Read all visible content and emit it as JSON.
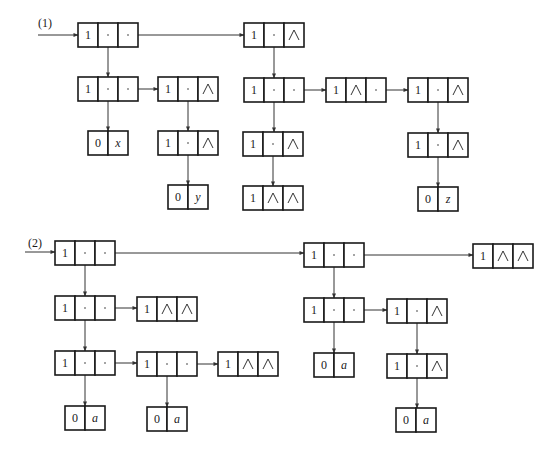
{
  "diagram": {
    "width": 557,
    "height": 462,
    "line_color": "#333333",
    "sections": [
      {
        "id": "section-1",
        "label": "(1)",
        "label_pos": [
          38,
          27
        ],
        "entry_arrow": {
          "from": [
            38,
            35
          ],
          "to": [
            78,
            35
          ]
        },
        "nodes": [
          {
            "id": "n1a",
            "x": 78,
            "y": 23,
            "cells": [
              "1",
              "ptr",
              "ptr"
            ]
          },
          {
            "id": "n1b",
            "x": 244,
            "y": 23,
            "cells": [
              "1",
              "ptr",
              "∧"
            ]
          },
          {
            "id": "n1a2",
            "x": 78,
            "y": 77,
            "cells": [
              "1",
              "ptr",
              "ptr"
            ]
          },
          {
            "id": "n1a3",
            "x": 158,
            "y": 77,
            "cells": [
              "1",
              "ptr",
              "∧"
            ]
          },
          {
            "id": "n1b2",
            "x": 244,
            "y": 78,
            "cells": [
              "1",
              "ptr",
              "ptr"
            ]
          },
          {
            "id": "n1b3",
            "x": 326,
            "y": 78,
            "cells": [
              "1",
              "∧",
              "ptr"
            ]
          },
          {
            "id": "n1b4",
            "x": 408,
            "y": 78,
            "cells": [
              "1",
              "ptr",
              "∧"
            ]
          },
          {
            "id": "n1x",
            "x": 88,
            "y": 131,
            "cells": [
              "0",
              "x"
            ],
            "atom": true
          },
          {
            "id": "n1a4",
            "x": 158,
            "y": 131,
            "cells": [
              "1",
              "ptr",
              "∧"
            ]
          },
          {
            "id": "n1b5",
            "x": 243,
            "y": 132,
            "cells": [
              "1",
              "ptr",
              "∧"
            ]
          },
          {
            "id": "n1b6",
            "x": 408,
            "y": 133,
            "cells": [
              "1",
              "ptr",
              "∧"
            ]
          },
          {
            "id": "n1y",
            "x": 168,
            "y": 185,
            "cells": [
              "0",
              "y"
            ],
            "atom": true
          },
          {
            "id": "n1b7",
            "x": 243,
            "y": 186,
            "cells": [
              "1",
              "∧",
              "∧"
            ]
          },
          {
            "id": "n1z",
            "x": 418,
            "y": 187,
            "cells": [
              "0",
              "z"
            ],
            "atom": true
          }
        ],
        "edges": [
          {
            "from": "n1a",
            "slot": 2,
            "to": "n1b",
            "dir": "right"
          },
          {
            "from": "n1a",
            "slot": 1,
            "to": "n1a2",
            "dir": "down"
          },
          {
            "from": "n1a2",
            "slot": 2,
            "to": "n1a3",
            "dir": "right"
          },
          {
            "from": "n1a2",
            "slot": 1,
            "to": "n1x",
            "dir": "down"
          },
          {
            "from": "n1a3",
            "slot": 1,
            "to": "n1a4",
            "dir": "down"
          },
          {
            "from": "n1a4",
            "slot": 1,
            "to": "n1y",
            "dir": "down"
          },
          {
            "from": "n1b",
            "slot": 1,
            "to": "n1b2",
            "dir": "down"
          },
          {
            "from": "n1b2",
            "slot": 2,
            "to": "n1b3",
            "dir": "right"
          },
          {
            "from": "n1b3",
            "slot": 2,
            "to": "n1b4",
            "dir": "right"
          },
          {
            "from": "n1b2",
            "slot": 1,
            "to": "n1b5",
            "dir": "down"
          },
          {
            "from": "n1b5",
            "slot": 1,
            "to": "n1b7",
            "dir": "down"
          },
          {
            "from": "n1b4",
            "slot": 1,
            "to": "n1b6",
            "dir": "down"
          },
          {
            "from": "n1b6",
            "slot": 1,
            "to": "n1z",
            "dir": "down"
          }
        ]
      },
      {
        "id": "section-2",
        "label": "(2)",
        "label_pos": [
          28,
          247
        ],
        "entry_arrow": {
          "from": [
            25,
            252
          ],
          "to": [
            55,
            252
          ]
        },
        "nodes": [
          {
            "id": "n2c",
            "x": 55,
            "y": 241,
            "cells": [
              "1",
              "ptr",
              "ptr"
            ]
          },
          {
            "id": "n2d",
            "x": 304,
            "y": 243,
            "cells": [
              "1",
              "ptr",
              "ptr"
            ]
          },
          {
            "id": "n2e",
            "x": 473,
            "y": 244,
            "cells": [
              "1",
              "∧",
              "∧"
            ]
          },
          {
            "id": "n2c2",
            "x": 55,
            "y": 296,
            "cells": [
              "1",
              "ptr",
              "ptr"
            ]
          },
          {
            "id": "n2c3",
            "x": 137,
            "y": 297,
            "cells": [
              "1",
              "∧",
              "∧"
            ]
          },
          {
            "id": "n2d2",
            "x": 304,
            "y": 298,
            "cells": [
              "1",
              "ptr",
              "ptr"
            ]
          },
          {
            "id": "n2d3",
            "x": 387,
            "y": 299,
            "cells": [
              "1",
              "ptr",
              "∧"
            ]
          },
          {
            "id": "n2c4",
            "x": 55,
            "y": 351,
            "cells": [
              "1",
              "ptr",
              "ptr"
            ]
          },
          {
            "id": "n2c5",
            "x": 137,
            "y": 352,
            "cells": [
              "1",
              "ptr",
              "ptr"
            ]
          },
          {
            "id": "n2c6",
            "x": 218,
            "y": 352,
            "cells": [
              "1",
              "∧",
              "∧"
            ]
          },
          {
            "id": "n2a1",
            "x": 314,
            "y": 353,
            "cells": [
              "0",
              "a"
            ],
            "atom": true
          },
          {
            "id": "n2d4",
            "x": 387,
            "y": 354,
            "cells": [
              "1",
              "ptr",
              "∧"
            ]
          },
          {
            "id": "n2a2",
            "x": 65,
            "y": 406,
            "cells": [
              "0",
              "a"
            ],
            "atom": true
          },
          {
            "id": "n2a3",
            "x": 147,
            "y": 407,
            "cells": [
              "0",
              "a"
            ],
            "atom": true
          },
          {
            "id": "n2a4",
            "x": 396,
            "y": 408,
            "cells": [
              "0",
              "a"
            ],
            "atom": true
          }
        ],
        "edges": [
          {
            "from": "n2c",
            "slot": 2,
            "to": "n2d",
            "dir": "right"
          },
          {
            "from": "n2d",
            "slot": 2,
            "to": "n2e",
            "dir": "right"
          },
          {
            "from": "n2c",
            "slot": 1,
            "to": "n2c2",
            "dir": "down"
          },
          {
            "from": "n2c2",
            "slot": 2,
            "to": "n2c3",
            "dir": "right"
          },
          {
            "from": "n2c2",
            "slot": 1,
            "to": "n2c4",
            "dir": "down"
          },
          {
            "from": "n2c4",
            "slot": 2,
            "to": "n2c5",
            "dir": "right"
          },
          {
            "from": "n2c5",
            "slot": 2,
            "to": "n2c6",
            "dir": "right"
          },
          {
            "from": "n2c4",
            "slot": 1,
            "to": "n2a2",
            "dir": "down"
          },
          {
            "from": "n2c5",
            "slot": 1,
            "to": "n2a3",
            "dir": "down"
          },
          {
            "from": "n2d",
            "slot": 1,
            "to": "n2d2",
            "dir": "down"
          },
          {
            "from": "n2d2",
            "slot": 2,
            "to": "n2d3",
            "dir": "right"
          },
          {
            "from": "n2d2",
            "slot": 1,
            "to": "n2a1",
            "dir": "down"
          },
          {
            "from": "n2d3",
            "slot": 1,
            "to": "n2d4",
            "dir": "down"
          },
          {
            "from": "n2d4",
            "slot": 1,
            "to": "n2a4",
            "dir": "down"
          }
        ]
      }
    ]
  },
  "legend": {
    "null_symbol": "∧",
    "pointer_cell": "ptr",
    "cell_width": 20,
    "cell_height": 24
  }
}
